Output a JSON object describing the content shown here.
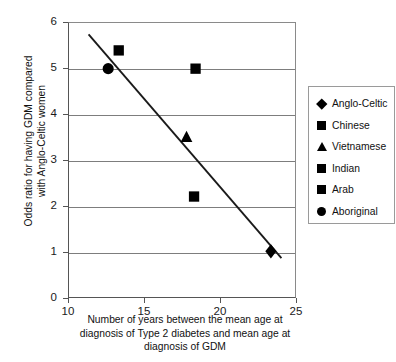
{
  "chart_data": {
    "type": "scatter",
    "title": "",
    "xlabel": "Number of years between the mean age at diagnosis of Type 2 diabetes and mean age at diagnosis of GDM",
    "xlabel_lines": [
      "Number of years between the mean age at",
      "diagnosis of Type 2 diabetes and mean age at",
      "diagnosis of GDM"
    ],
    "ylabel": "Odds ratio for having GDM compared with Anglo-Celtic women",
    "ylabel_lines": [
      "Odds ratio for having GDM compared",
      "with Anglo-Celtic women"
    ],
    "xlim": [
      10,
      25
    ],
    "ylim": [
      0,
      6
    ],
    "xticks": [
      "10",
      "15",
      "20",
      "25"
    ],
    "xtick_values": [
      10,
      15,
      20,
      25
    ],
    "yticks": [
      "0",
      "1",
      "2",
      "3",
      "4",
      "5",
      "6"
    ],
    "ytick_values": [
      0,
      1,
      2,
      3,
      4,
      5,
      6
    ],
    "grid": "horizontal",
    "legend_position": "right",
    "points": [
      {
        "label": "Anglo-Celtic",
        "marker": "diamond",
        "x": 23.4,
        "y": 1.0
      },
      {
        "label": "Chinese",
        "marker": "square",
        "x": 18.4,
        "y": 5.0
      },
      {
        "label": "Vietnamese",
        "marker": "triangle",
        "x": 17.8,
        "y": 3.5
      },
      {
        "label": "Indian",
        "marker": "square",
        "x": 18.3,
        "y": 2.2
      },
      {
        "label": "Arab",
        "marker": "square",
        "x": 13.3,
        "y": 5.4
      },
      {
        "label": "Aboriginal",
        "marker": "circle",
        "x": 12.6,
        "y": 5.0
      }
    ],
    "trendline": {
      "x0": 11.3,
      "y0": 5.75,
      "x1": 24.1,
      "y1": 0.85
    },
    "legend": [
      {
        "label": "Anglo-Celtic",
        "marker": "diamond"
      },
      {
        "label": "Chinese",
        "marker": "square"
      },
      {
        "label": "Vietnamese",
        "marker": "triangle"
      },
      {
        "label": "Indian",
        "marker": "square"
      },
      {
        "label": "Arab",
        "marker": "square"
      },
      {
        "label": "Aboriginal",
        "marker": "circle"
      }
    ],
    "colors": {
      "marker": "#000000",
      "trendline": "#1a1a1a",
      "grid": "#7d7d7d",
      "axis": "#555555"
    }
  }
}
